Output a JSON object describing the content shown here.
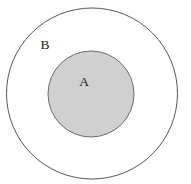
{
  "figure": {
    "kind": "euler-diagram",
    "width": 191,
    "height": 184,
    "background_color": "#ffffff"
  },
  "colors": {
    "background": "#ffffff",
    "outer_fill": "#ffffff",
    "outer_stroke": "#555555",
    "inner_fill": "#d0d0d0",
    "inner_stroke": "#6b6b6b",
    "label_color": "#1c1c1c"
  },
  "shapes": {
    "outer_circle": {
      "name": "B",
      "cx": 92,
      "cy": 93.5,
      "r": 85.5,
      "fill": "#ffffff",
      "stroke": "#555555",
      "stroke_width": 1
    },
    "inner_circle": {
      "name": "A",
      "cx": 91,
      "cy": 94,
      "r": 43,
      "fill": "#d0d0d0",
      "stroke": "#6b6b6b",
      "stroke_width": 1
    }
  },
  "labels": {
    "outer": {
      "text": "B",
      "x": 45,
      "y": 46,
      "font_size": 13.5
    },
    "inner": {
      "text": "A",
      "x": 84,
      "y": 83,
      "font_size": 13.5
    }
  }
}
